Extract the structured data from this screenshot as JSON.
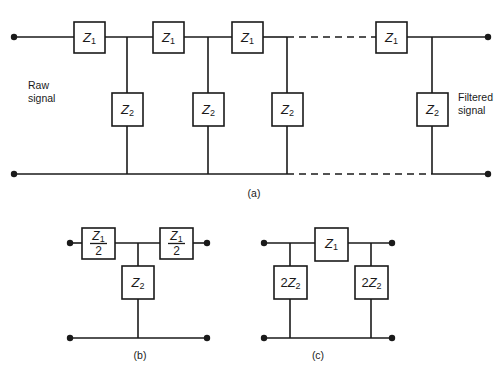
{
  "figure": {
    "colors": {
      "ink": "#1a1a1a",
      "background": "#ffffff"
    },
    "labels": {
      "raw_signal_line1": "Raw",
      "raw_signal_line2": "signal",
      "filtered_signal_line1": "Filtered",
      "filtered_signal_line2": "signal"
    },
    "captions": {
      "a": "(a)",
      "b": "(b)",
      "c": "(c)"
    }
  },
  "panel_a": {
    "caption": "(a)",
    "series_boxes": [
      {
        "symbol": "Z",
        "subscript": "1"
      },
      {
        "symbol": "Z",
        "subscript": "1"
      },
      {
        "symbol": "Z",
        "subscript": "1"
      },
      {
        "symbol": "Z",
        "subscript": "1"
      }
    ],
    "shunt_boxes": [
      {
        "symbol": "Z",
        "subscript": "2"
      },
      {
        "symbol": "Z",
        "subscript": "2"
      },
      {
        "symbol": "Z",
        "subscript": "2"
      },
      {
        "symbol": "Z",
        "subscript": "2"
      }
    ],
    "input_label_line1": "Raw",
    "input_label_line2": "signal",
    "output_label_line1": "Filtered",
    "output_label_line2": "signal",
    "continuation": "dashed"
  },
  "panel_b": {
    "caption": "(b)",
    "series_boxes": [
      {
        "numerator_symbol": "Z",
        "numerator_subscript": "1",
        "denominator": "2"
      },
      {
        "numerator_symbol": "Z",
        "numerator_subscript": "1",
        "denominator": "2"
      }
    ],
    "shunt_boxes": [
      {
        "symbol": "Z",
        "subscript": "2"
      }
    ]
  },
  "panel_c": {
    "caption": "(c)",
    "series_boxes": [
      {
        "symbol": "Z",
        "subscript": "1"
      }
    ],
    "shunt_boxes": [
      {
        "coefficient": "2",
        "symbol": "Z",
        "subscript": "2"
      },
      {
        "coefficient": "2",
        "symbol": "Z",
        "subscript": "2"
      }
    ]
  }
}
